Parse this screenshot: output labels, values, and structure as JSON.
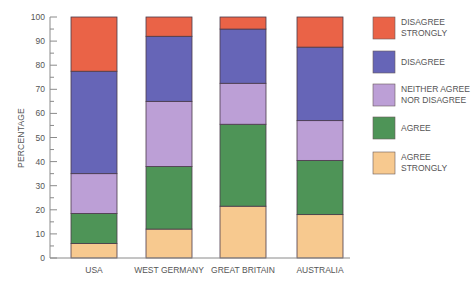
{
  "chart_data": {
    "type": "bar",
    "stacked": true,
    "title": "",
    "xlabel": "",
    "ylabel": "PERCENTAGE",
    "ylim": [
      0,
      100
    ],
    "yticks": [
      0,
      10,
      20,
      30,
      40,
      50,
      60,
      70,
      80,
      90,
      100
    ],
    "grid": false,
    "legend_position": "right",
    "categories": [
      "USA",
      "WEST GERMANY",
      "GREAT BRITAIN",
      "AUSTRALIA"
    ],
    "series": [
      {
        "name": "AGREE STRONGLY",
        "label_lines": [
          "AGREE",
          "STRONGLY"
        ],
        "color": "#f7c98f",
        "values": [
          6,
          12,
          21.5,
          18
        ]
      },
      {
        "name": "AGREE",
        "label_lines": [
          "AGREE"
        ],
        "color": "#4e9457",
        "values": [
          12.5,
          26,
          34,
          22.5
        ]
      },
      {
        "name": "NEITHER AGREE NOR DISAGREE",
        "label_lines": [
          "NEITHER AGREE",
          "NOR DISAGREE"
        ],
        "color": "#bc9fd6",
        "values": [
          16.5,
          27,
          17,
          16.5
        ]
      },
      {
        "name": "DISAGREE",
        "label_lines": [
          "DISAGREE"
        ],
        "color": "#6665b7",
        "values": [
          42.5,
          27,
          22.5,
          30.5
        ]
      },
      {
        "name": "DISAGREE STRONGLY",
        "label_lines": [
          "DISAGREE",
          "STRONGLY"
        ],
        "color": "#ea6347",
        "values": [
          22.5,
          8,
          5,
          12.5
        ]
      }
    ],
    "legend_order": [
      "DISAGREE STRONGLY",
      "DISAGREE",
      "NEITHER AGREE NOR DISAGREE",
      "AGREE",
      "AGREE STRONGLY"
    ]
  }
}
